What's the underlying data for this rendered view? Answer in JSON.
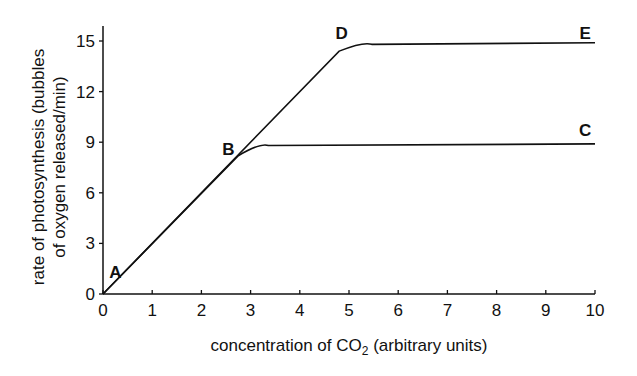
{
  "chart_data": {
    "type": "line",
    "title": "",
    "xlabel": "concentration of CO2 (arbitrary units)",
    "xlabel_parts": {
      "pre": "concentration of CO",
      "sub": "2",
      "post": " (arbitrary units)"
    },
    "ylabel": "rate of photosynthesis (bubbles of oxygen released/min)",
    "ylabel_lines": [
      "rate of photosynthesis (bubbles",
      "of oxygen released/min)"
    ],
    "xlim": [
      0,
      10
    ],
    "ylim": [
      0,
      15
    ],
    "x_ticks": [
      "0",
      "1",
      "2",
      "3",
      "4",
      "5",
      "6",
      "7",
      "8",
      "9",
      "10"
    ],
    "y_ticks": [
      "0",
      "3",
      "6",
      "9",
      "12",
      "15"
    ],
    "grid": false,
    "legend": null,
    "series": [
      {
        "name": "A-B-C",
        "x": [
          0,
          2.75,
          3.2,
          10
        ],
        "y": [
          0,
          8.2,
          8.8,
          8.9
        ]
      },
      {
        "name": "A-B-D-E",
        "x": [
          0,
          4.8,
          5.3,
          10
        ],
        "y": [
          0,
          14.4,
          14.8,
          14.9
        ]
      }
    ],
    "annotations": [
      {
        "text": "A",
        "x": 0.25,
        "y": 1.3
      },
      {
        "text": "B",
        "x": 2.55,
        "y": 8.6
      },
      {
        "text": "C",
        "x": 9.8,
        "y": 9.7
      },
      {
        "text": "D",
        "x": 4.85,
        "y": 15.5
      },
      {
        "text": "E",
        "x": 9.8,
        "y": 15.5
      }
    ]
  }
}
